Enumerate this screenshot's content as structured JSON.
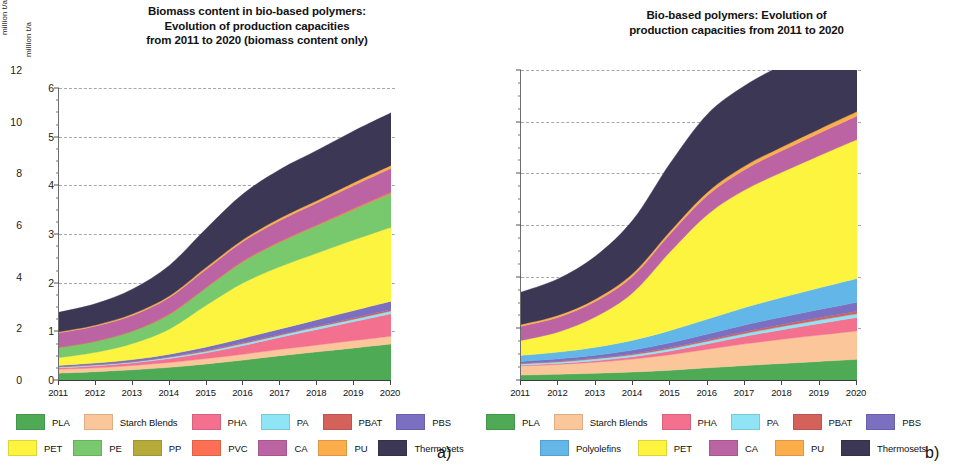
{
  "panel_a": {
    "letter": "a)",
    "title": "Biomass content in bio-based polymers: Evolution of production capacities from 2011 to 2020 (biomass content only)",
    "title_lines": [
      "Biomass content in bio-based polymers:",
      "Evolution of production capacities",
      "from 2011 to 2020 (biomass content only)"
    ],
    "ylabel": "million t/a",
    "legend_rows": [
      [
        {
          "label": "PLA",
          "color": "#4faa55"
        },
        {
          "label": "Starch Blends",
          "color": "#fbc79a"
        },
        {
          "label": "PHA",
          "color": "#f4708f"
        },
        {
          "label": "PA",
          "color": "#8fe4f5"
        },
        {
          "label": "PBAT",
          "color": "#d4625a"
        },
        {
          "label": "PBS",
          "color": "#7a6fc0"
        }
      ],
      [
        {
          "label": "PET",
          "color": "#fcf43f"
        },
        {
          "label": "PE",
          "color": "#78c86e"
        },
        {
          "label": "PP",
          "color": "#b5aa3a"
        },
        {
          "label": "PVC",
          "color": "#fb7054"
        },
        {
          "label": "CA",
          "color": "#bc63a4"
        },
        {
          "label": "PU",
          "color": "#fcae4a"
        },
        {
          "label": "Thermosets",
          "color": "#3b3755"
        }
      ]
    ]
  },
  "panel_b": {
    "letter": "b)",
    "title": "Bio-based polymers: Evolution of production capacities from 2011 to 2020",
    "title_lines": [
      "Bio-based polymers: Evolution of",
      "production capacities from 2011 to 2020"
    ],
    "ylabel": "million t/a",
    "legend_rows": [
      [
        {
          "label": "PLA",
          "color": "#4faa55"
        },
        {
          "label": "Starch Blends",
          "color": "#fbc79a"
        },
        {
          "label": "PHA",
          "color": "#f4708f"
        },
        {
          "label": "PA",
          "color": "#8fe4f5"
        },
        {
          "label": "PBAT",
          "color": "#d4625a"
        },
        {
          "label": "PBS",
          "color": "#7a6fc0"
        }
      ],
      [
        {
          "label": "Polyolefins",
          "color": "#62b7e8"
        },
        {
          "label": "PET",
          "color": "#fcf43f"
        },
        {
          "label": "CA",
          "color": "#bc63a4"
        },
        {
          "label": "PU",
          "color": "#fcae4a"
        },
        {
          "label": "Thermosets",
          "color": "#3b3755"
        }
      ]
    ]
  },
  "chart_data": [
    {
      "id": "a",
      "type": "area",
      "stacked": true,
      "title": "Biomass content in bio-based polymers: Evolution of production capacities from 2011 to 2020 (biomass content only)",
      "xlabel": "",
      "ylabel": "million t/a",
      "x": [
        2011,
        2012,
        2013,
        2014,
        2015,
        2016,
        2017,
        2018,
        2019,
        2020
      ],
      "categories": [
        "2011",
        "2012",
        "2013",
        "2014",
        "2015",
        "2016",
        "2017",
        "2018",
        "2019",
        "2020"
      ],
      "ylim": [
        0,
        6
      ],
      "yticks": [
        0,
        1,
        2,
        3,
        4,
        5,
        6
      ],
      "grid": true,
      "legend_position": "below",
      "series": [
        {
          "name": "PLA",
          "color": "#4faa55",
          "values": [
            0.14,
            0.17,
            0.21,
            0.26,
            0.33,
            0.41,
            0.5,
            0.58,
            0.66,
            0.74
          ]
        },
        {
          "name": "Starch Blends",
          "color": "#fbc79a",
          "values": [
            0.08,
            0.08,
            0.09,
            0.1,
            0.11,
            0.12,
            0.13,
            0.14,
            0.15,
            0.16
          ]
        },
        {
          "name": "PHA",
          "color": "#f4708f",
          "values": [
            0.03,
            0.04,
            0.05,
            0.08,
            0.12,
            0.18,
            0.25,
            0.32,
            0.39,
            0.46
          ]
        },
        {
          "name": "PA",
          "color": "#8fe4f5",
          "values": [
            0.02,
            0.02,
            0.02,
            0.03,
            0.03,
            0.04,
            0.04,
            0.05,
            0.05,
            0.06
          ]
        },
        {
          "name": "PBAT",
          "color": "#d4625a",
          "values": [
            0.01,
            0.01,
            0.01,
            0.01,
            0.02,
            0.02,
            0.02,
            0.02,
            0.03,
            0.03
          ]
        },
        {
          "name": "PBS",
          "color": "#7a6fc0",
          "values": [
            0.02,
            0.03,
            0.04,
            0.05,
            0.07,
            0.09,
            0.11,
            0.13,
            0.15,
            0.17
          ]
        },
        {
          "name": "PET",
          "color": "#fcf43f",
          "values": [
            0.16,
            0.22,
            0.33,
            0.52,
            0.86,
            1.14,
            1.28,
            1.37,
            1.45,
            1.52
          ]
        },
        {
          "name": "PE",
          "color": "#78c86e",
          "values": [
            0.21,
            0.23,
            0.26,
            0.3,
            0.36,
            0.43,
            0.5,
            0.56,
            0.62,
            0.68
          ]
        },
        {
          "name": "PP",
          "color": "#b5aa3a",
          "values": [
            0.0,
            0.0,
            0.0,
            0.0,
            0.0,
            0.01,
            0.01,
            0.01,
            0.01,
            0.02
          ]
        },
        {
          "name": "PVC",
          "color": "#fb7054",
          "values": [
            0.0,
            0.0,
            0.0,
            0.01,
            0.01,
            0.01,
            0.01,
            0.01,
            0.02,
            0.02
          ]
        },
        {
          "name": "CA",
          "color": "#bc63a4",
          "values": [
            0.3,
            0.31,
            0.32,
            0.34,
            0.37,
            0.4,
            0.43,
            0.45,
            0.47,
            0.49
          ]
        },
        {
          "name": "PU",
          "color": "#fcae4a",
          "values": [
            0.02,
            0.02,
            0.03,
            0.03,
            0.04,
            0.04,
            0.05,
            0.05,
            0.06,
            0.06
          ]
        },
        {
          "name": "Thermosets",
          "color": "#3b3755",
          "values": [
            0.4,
            0.44,
            0.51,
            0.63,
            0.8,
            0.94,
            1.0,
            1.03,
            1.06,
            1.08
          ]
        }
      ],
      "totals": [
        1.39,
        1.57,
        1.87,
        2.36,
        3.12,
        3.83,
        4.33,
        4.72,
        5.12,
        5.49
      ]
    },
    {
      "id": "b",
      "type": "area",
      "stacked": true,
      "title": "Bio-based polymers: Evolution of production capacities from 2011 to 2020",
      "xlabel": "",
      "ylabel": "million t/a",
      "x": [
        2011,
        2012,
        2013,
        2014,
        2015,
        2016,
        2017,
        2018,
        2019,
        2020
      ],
      "categories": [
        "2011",
        "2012",
        "2013",
        "2014",
        "2015",
        "2016",
        "2017",
        "2018",
        "2019",
        "2020"
      ],
      "ylim": [
        0,
        12
      ],
      "yticks": [
        0,
        2,
        4,
        6,
        8,
        10,
        12
      ],
      "grid": true,
      "legend_position": "below",
      "series": [
        {
          "name": "PLA",
          "color": "#4faa55",
          "values": [
            0.19,
            0.22,
            0.26,
            0.31,
            0.38,
            0.47,
            0.56,
            0.64,
            0.72,
            0.8
          ]
        },
        {
          "name": "Starch Blends",
          "color": "#fbc79a",
          "values": [
            0.35,
            0.38,
            0.43,
            0.5,
            0.6,
            0.72,
            0.84,
            0.94,
            1.02,
            1.1
          ]
        },
        {
          "name": "PHA",
          "color": "#f4708f",
          "values": [
            0.03,
            0.04,
            0.06,
            0.09,
            0.14,
            0.21,
            0.29,
            0.37,
            0.45,
            0.52
          ]
        },
        {
          "name": "PA",
          "color": "#8fe4f5",
          "values": [
            0.06,
            0.06,
            0.07,
            0.08,
            0.09,
            0.1,
            0.11,
            0.12,
            0.13,
            0.14
          ]
        },
        {
          "name": "PBAT",
          "color": "#d4625a",
          "values": [
            0.02,
            0.03,
            0.03,
            0.04,
            0.05,
            0.06,
            0.07,
            0.08,
            0.09,
            0.1
          ]
        },
        {
          "name": "PBS",
          "color": "#7a6fc0",
          "values": [
            0.07,
            0.09,
            0.11,
            0.14,
            0.18,
            0.22,
            0.26,
            0.29,
            0.32,
            0.35
          ]
        },
        {
          "name": "Polyolefins",
          "color": "#62b7e8",
          "values": [
            0.23,
            0.26,
            0.31,
            0.38,
            0.48,
            0.58,
            0.68,
            0.76,
            0.84,
            0.92
          ]
        },
        {
          "name": "PET",
          "color": "#fcf43f",
          "values": [
            0.58,
            0.78,
            1.18,
            1.85,
            3.05,
            4.05,
            4.55,
            4.85,
            5.12,
            5.38
          ]
        },
        {
          "name": "CA",
          "color": "#bc63a4",
          "values": [
            0.55,
            0.57,
            0.6,
            0.64,
            0.69,
            0.74,
            0.79,
            0.83,
            0.87,
            0.91
          ]
        },
        {
          "name": "PU",
          "color": "#fcae4a",
          "values": [
            0.07,
            0.08,
            0.09,
            0.1,
            0.11,
            0.13,
            0.14,
            0.15,
            0.16,
            0.17
          ]
        },
        {
          "name": "Thermosets",
          "color": "#3b3755",
          "values": [
            1.25,
            1.41,
            1.66,
            2.07,
            2.63,
            3.02,
            3.11,
            3.17,
            3.25,
            3.32
          ]
        }
      ],
      "totals": [
        3.4,
        3.92,
        4.8,
        6.2,
        8.4,
        10.3,
        11.4,
        12.2,
        12.97,
        13.71
      ]
    }
  ]
}
